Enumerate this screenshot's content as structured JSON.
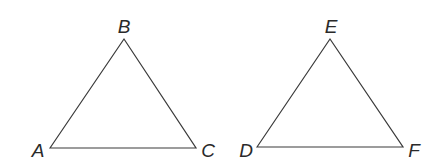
{
  "diagram": {
    "triangles": [
      {
        "name": "ABC",
        "vertices": [
          {
            "label": "A",
            "x": 50,
            "y": 148,
            "lx": 38,
            "ly": 157
          },
          {
            "label": "B",
            "x": 124,
            "y": 39,
            "lx": 124,
            "ly": 33
          },
          {
            "label": "C",
            "x": 196,
            "y": 148,
            "lx": 208,
            "ly": 157
          }
        ]
      },
      {
        "name": "DEF",
        "vertices": [
          {
            "label": "D",
            "x": 257,
            "y": 147,
            "lx": 246,
            "ly": 157
          },
          {
            "label": "E",
            "x": 330,
            "y": 39,
            "lx": 331,
            "ly": 33
          },
          {
            "label": "F",
            "x": 403,
            "y": 147,
            "lx": 414,
            "ly": 157
          }
        ]
      }
    ],
    "stroke_color": "#3a3a3a",
    "label_color": "#2a2a2a"
  }
}
